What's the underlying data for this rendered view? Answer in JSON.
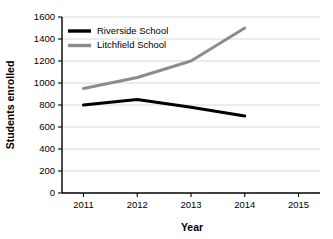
{
  "chart_data": {
    "type": "line",
    "title": "",
    "xlabel": "Year",
    "ylabel": "Students enrolled",
    "categories": [
      "2011",
      "2012",
      "2013",
      "2014",
      "2015"
    ],
    "x": [
      2011,
      2012,
      2013,
      2014,
      2015
    ],
    "xlim": [
      2010.6,
      2015.4
    ],
    "ylim": [
      0,
      1600
    ],
    "grid": "horizontal",
    "legend_position": "top-left",
    "y_ticks": [
      0,
      200,
      400,
      600,
      800,
      1000,
      1200,
      1400,
      1600
    ],
    "y_tick_labels": [
      "0",
      "200",
      "400",
      "600",
      "800",
      "1000",
      "1200",
      "1400",
      "1600"
    ],
    "x_ticks": [
      2011,
      2012,
      2013,
      2014,
      2015
    ],
    "x_tick_labels": [
      "2011",
      "2012",
      "2013",
      "2014",
      "2015"
    ],
    "series": [
      {
        "name": "Riverside School",
        "color": "#000000",
        "x": [
          2011,
          2012,
          2013,
          2014
        ],
        "values": [
          800,
          850,
          780,
          700
        ]
      },
      {
        "name": "Litchfield School",
        "color": "#8c8c8c",
        "x": [
          2011,
          2012,
          2013,
          2014
        ],
        "values": [
          950,
          1050,
          1200,
          1500
        ]
      }
    ]
  },
  "axes": {
    "y_label": "Students enrolled",
    "x_label": "Year",
    "y_ticks": [
      {
        "label": "1600"
      },
      {
        "label": "1400"
      },
      {
        "label": "1200"
      },
      {
        "label": "1000"
      },
      {
        "label": "800"
      },
      {
        "label": "600"
      },
      {
        "label": "400"
      },
      {
        "label": "200"
      },
      {
        "label": "0"
      }
    ],
    "x_ticks": [
      {
        "label": "2011"
      },
      {
        "label": "2012"
      },
      {
        "label": "2013"
      },
      {
        "label": "2014"
      },
      {
        "label": "2015"
      }
    ]
  },
  "legend": {
    "items": [
      {
        "label": "Riverside School",
        "color": "#000000"
      },
      {
        "label": "Litchfield School",
        "color": "#8c8c8c"
      }
    ]
  },
  "colors": {
    "background": "#ffffff",
    "axis": "#000000",
    "grid": "#c9c9c9",
    "series_riverside": "#000000",
    "series_litchfield": "#8c8c8c"
  }
}
